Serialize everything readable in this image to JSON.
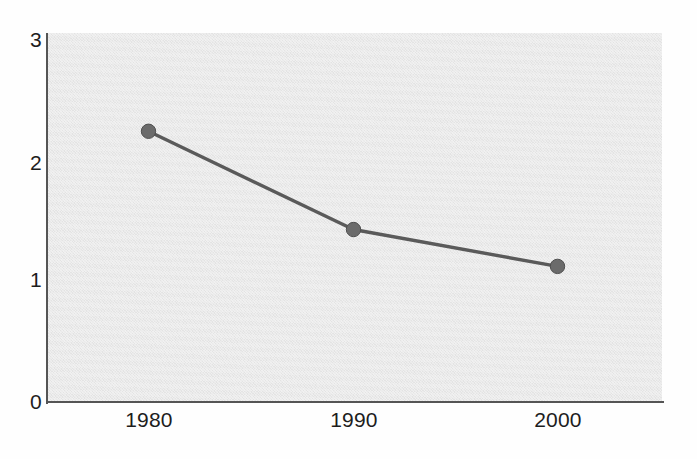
{
  "chart_data": {
    "type": "line",
    "title": "",
    "subtitle": "",
    "xlabel": "",
    "ylabel": "",
    "categories": [
      "1980",
      "1990",
      "2000"
    ],
    "x": [
      1980,
      1990,
      2000
    ],
    "values": [
      2.2,
      1.4,
      1.1
    ],
    "series": [
      {
        "name": "series-1",
        "values": [
          2.2,
          1.4,
          1.1
        ]
      }
    ],
    "ylim": [
      0,
      3
    ],
    "y_ticks": [
      "0",
      "1",
      "2",
      "3"
    ],
    "y_tick_values": [
      0,
      1,
      2,
      3
    ],
    "x_ticks": [
      "1980",
      "1990",
      "2000"
    ],
    "grid": false,
    "legend": "none",
    "markers": true,
    "marker_shape": "circle",
    "colors": {
      "line": "#5a5a5a",
      "marker": "#6b6b6b",
      "marker_edge": "#4f4f4f",
      "plot_background": "#e9e9e9",
      "figure_background": "#fefefe",
      "axis": "#555555",
      "tick_label": "#1d1d1d"
    },
    "data_labels": []
  },
  "axes": {
    "y": {
      "ticks": [
        {
          "label": "3",
          "value": 3
        },
        {
          "label": "2",
          "value": 2
        },
        {
          "label": "1",
          "value": 1
        },
        {
          "label": "0",
          "value": 0
        }
      ]
    },
    "x": {
      "ticks": [
        {
          "label": "1980",
          "value": 1980
        },
        {
          "label": "1990",
          "value": 1990
        },
        {
          "label": "2000",
          "value": 2000
        }
      ]
    }
  }
}
